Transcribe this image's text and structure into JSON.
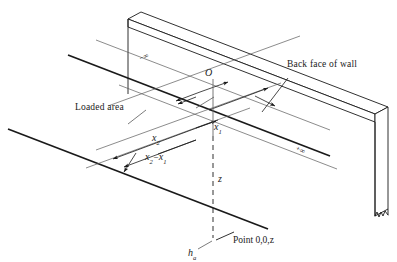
{
  "figure": {
    "kind": "engineering-isometric-diagram",
    "background_color": "#ffffff",
    "line_color": "#1a1a1a",
    "thin_line_color": "#555555",
    "width_px": 397,
    "height_px": 262
  },
  "annotations": {
    "back_face_of_wall": "Back face of wall",
    "loaded_area": "Loaded area",
    "point_label": "Point 0,0,z",
    "origin": "O",
    "depth": "z",
    "wall_height": "h",
    "wall_height_subscript": "a",
    "x1": "x",
    "x1_subscript": "1",
    "x2": "x",
    "x2_subscript": "2",
    "difference_first": "x",
    "difference_first_subscript": "2",
    "difference_operator": "−",
    "difference_second": "x",
    "difference_second_subscript": "1",
    "infinity_negative_sign": "−",
    "infinity_positive_sign": "+",
    "infinity_symbol": "∞"
  },
  "colors": {
    "stroke": "#1a1a1a",
    "stroke_light": "#5a5a5a",
    "stroke_mid": "#3c3c3c",
    "paper": "#ffffff"
  }
}
